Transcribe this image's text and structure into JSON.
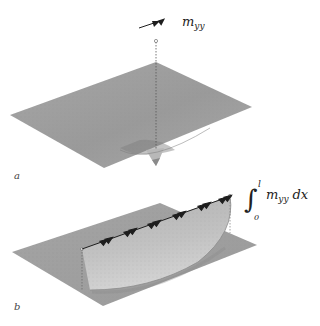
{
  "figure": {
    "panels": [
      {
        "label": "a",
        "annotation": {
          "symbol": "m",
          "subscript": "yy"
        },
        "description": "plate surface with localized depression under point moment"
      },
      {
        "label": "b",
        "annotation": {
          "integral_lower": "0",
          "integral_upper": "l",
          "integrand": "m",
          "integrand_subscript": "yy",
          "differential": "dx"
        },
        "description": "plate surface with cylindrical bulge under line of moments"
      }
    ],
    "colors": {
      "surface": "#9c9c9c",
      "surface_light": "#c4c4c4",
      "arrow": "#1e1e1e",
      "dashed": "#555555",
      "background": "#ffffff"
    }
  }
}
